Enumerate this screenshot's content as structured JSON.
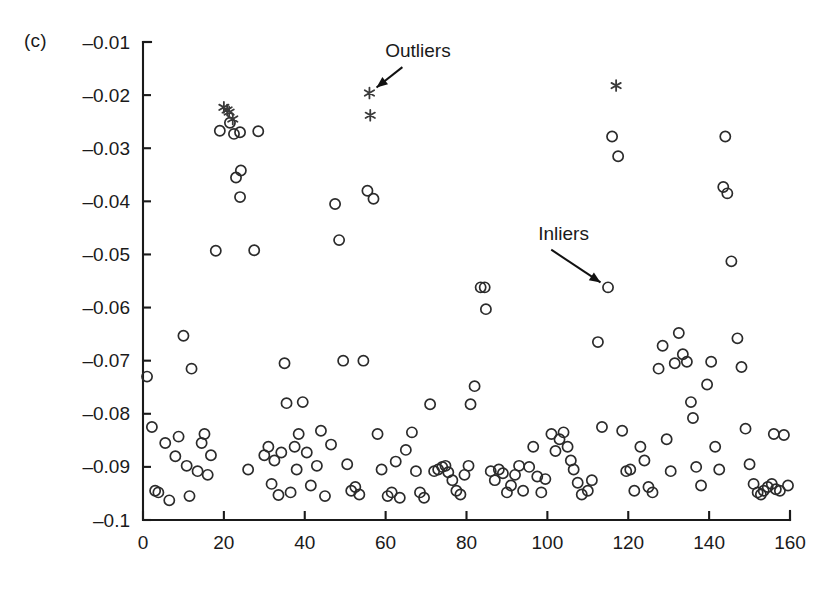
{
  "figure": {
    "panel_label": "(c)"
  },
  "annotations": [
    {
      "name": "outliers",
      "text": "Outliers",
      "x_data": 68.0,
      "y_data": -0.0128,
      "target_x": 56.0,
      "target_y": -0.0196
    },
    {
      "name": "inliers",
      "text": "Inliers",
      "x_data": 104.0,
      "y_data": -0.0472,
      "target_x": 115.0,
      "target_y": -0.0562
    }
  ],
  "chart_data": {
    "type": "scatter",
    "title": "",
    "xlabel": "",
    "ylabel": "",
    "xlim": [
      0,
      160
    ],
    "ylim": [
      -0.1,
      -0.01
    ],
    "grid": false,
    "legend": "none",
    "xticks": [
      0,
      20,
      40,
      60,
      80,
      100,
      120,
      140,
      160
    ],
    "xtick_labels": [
      "0",
      "20",
      "40",
      "60",
      "80",
      "100",
      "120",
      "140",
      "160"
    ],
    "yticks": [
      -0.01,
      -0.02,
      -0.03,
      -0.04,
      -0.05,
      -0.06,
      -0.07,
      -0.08,
      -0.09,
      -0.1
    ],
    "ytick_labels": [
      "–0.01",
      "–0.02",
      "–0.03",
      "–0.04",
      "–0.05",
      "–0.06",
      "–0.07",
      "–0.08",
      "–0.09",
      "–0.1"
    ],
    "series": [
      {
        "name": "Inliers",
        "marker": "circle-open",
        "color": "#2b2b2b",
        "points": [
          [
            1.0,
            -0.073
          ],
          [
            2.2,
            -0.0825
          ],
          [
            3.0,
            -0.0945
          ],
          [
            3.8,
            -0.0948
          ],
          [
            5.5,
            -0.0855
          ],
          [
            6.5,
            -0.0963
          ],
          [
            8.0,
            -0.088
          ],
          [
            8.8,
            -0.0843
          ],
          [
            10.0,
            -0.0653
          ],
          [
            10.8,
            -0.0898
          ],
          [
            11.5,
            -0.0955
          ],
          [
            12.0,
            -0.0715
          ],
          [
            13.5,
            -0.0908
          ],
          [
            14.5,
            -0.0855
          ],
          [
            15.2,
            -0.0838
          ],
          [
            16.0,
            -0.0915
          ],
          [
            16.8,
            -0.0878
          ],
          [
            18.0,
            -0.0493
          ],
          [
            19.0,
            -0.0267
          ],
          [
            21.5,
            -0.0252
          ],
          [
            22.5,
            -0.0273
          ],
          [
            24.0,
            -0.027
          ],
          [
            23.0,
            -0.0355
          ],
          [
            24.2,
            -0.0342
          ],
          [
            24.0,
            -0.0392
          ],
          [
            26.0,
            -0.0905
          ],
          [
            27.5,
            -0.0492
          ],
          [
            28.5,
            -0.0268
          ],
          [
            30.0,
            -0.0878
          ],
          [
            31.0,
            -0.0862
          ],
          [
            31.8,
            -0.0932
          ],
          [
            32.5,
            -0.0888
          ],
          [
            33.5,
            -0.0953
          ],
          [
            34.2,
            -0.0873
          ],
          [
            35.0,
            -0.0705
          ],
          [
            35.5,
            -0.078
          ],
          [
            36.5,
            -0.0948
          ],
          [
            37.5,
            -0.0862
          ],
          [
            38.5,
            -0.0838
          ],
          [
            38.0,
            -0.0905
          ],
          [
            39.5,
            -0.0778
          ],
          [
            40.5,
            -0.0873
          ],
          [
            41.5,
            -0.0935
          ],
          [
            43.0,
            -0.0898
          ],
          [
            44.0,
            -0.0832
          ],
          [
            45.0,
            -0.0955
          ],
          [
            46.5,
            -0.0858
          ],
          [
            47.5,
            -0.0405
          ],
          [
            48.5,
            -0.0473
          ],
          [
            49.5,
            -0.07
          ],
          [
            50.5,
            -0.0895
          ],
          [
            51.5,
            -0.0945
          ],
          [
            52.5,
            -0.0938
          ],
          [
            53.5,
            -0.0952
          ],
          [
            54.5,
            -0.07
          ],
          [
            55.5,
            -0.038
          ],
          [
            57.0,
            -0.0395
          ],
          [
            58.0,
            -0.0838
          ],
          [
            59.0,
            -0.0905
          ],
          [
            60.5,
            -0.0955
          ],
          [
            61.5,
            -0.0948
          ],
          [
            62.5,
            -0.089
          ],
          [
            63.5,
            -0.0958
          ],
          [
            65.0,
            -0.0868
          ],
          [
            66.5,
            -0.0835
          ],
          [
            67.5,
            -0.0908
          ],
          [
            68.5,
            -0.0948
          ],
          [
            69.5,
            -0.0958
          ],
          [
            71.0,
            -0.0782
          ],
          [
            72.0,
            -0.0908
          ],
          [
            73.0,
            -0.0905
          ],
          [
            74.0,
            -0.09
          ],
          [
            74.8,
            -0.0898
          ],
          [
            75.5,
            -0.091
          ],
          [
            76.5,
            -0.0925
          ],
          [
            77.5,
            -0.0945
          ],
          [
            78.5,
            -0.0952
          ],
          [
            79.5,
            -0.0915
          ],
          [
            80.5,
            -0.0898
          ],
          [
            81.0,
            -0.0782
          ],
          [
            82.0,
            -0.0748
          ],
          [
            83.5,
            -0.0562
          ],
          [
            84.5,
            -0.0562
          ],
          [
            84.8,
            -0.0603
          ],
          [
            86.0,
            -0.0908
          ],
          [
            87.0,
            -0.0925
          ],
          [
            88.0,
            -0.0905
          ],
          [
            89.0,
            -0.0912
          ],
          [
            90.0,
            -0.0948
          ],
          [
            91.0,
            -0.0935
          ],
          [
            92.0,
            -0.0915
          ],
          [
            93.0,
            -0.0898
          ],
          [
            94.0,
            -0.0945
          ],
          [
            95.5,
            -0.09
          ],
          [
            96.5,
            -0.0862
          ],
          [
            97.5,
            -0.0918
          ],
          [
            98.5,
            -0.0948
          ],
          [
            99.5,
            -0.0923
          ],
          [
            101.0,
            -0.0838
          ],
          [
            102.0,
            -0.087
          ],
          [
            103.0,
            -0.0848
          ],
          [
            104.0,
            -0.0835
          ],
          [
            105.0,
            -0.0862
          ],
          [
            105.8,
            -0.0888
          ],
          [
            106.5,
            -0.0905
          ],
          [
            107.5,
            -0.093
          ],
          [
            108.5,
            -0.0952
          ],
          [
            110.0,
            -0.0945
          ],
          [
            111.0,
            -0.0925
          ],
          [
            112.5,
            -0.0665
          ],
          [
            113.5,
            -0.0825
          ],
          [
            115.0,
            -0.0562
          ],
          [
            116.0,
            -0.0278
          ],
          [
            117.5,
            -0.0315
          ],
          [
            118.5,
            -0.0832
          ],
          [
            119.5,
            -0.0908
          ],
          [
            120.5,
            -0.0905
          ],
          [
            121.5,
            -0.0945
          ],
          [
            123.0,
            -0.0862
          ],
          [
            124.0,
            -0.0888
          ],
          [
            125.0,
            -0.0938
          ],
          [
            126.0,
            -0.0948
          ],
          [
            127.5,
            -0.0715
          ],
          [
            128.5,
            -0.0672
          ],
          [
            129.5,
            -0.0848
          ],
          [
            130.5,
            -0.0908
          ],
          [
            131.5,
            -0.0705
          ],
          [
            132.5,
            -0.0648
          ],
          [
            133.5,
            -0.0688
          ],
          [
            134.5,
            -0.0702
          ],
          [
            135.5,
            -0.0778
          ],
          [
            136.0,
            -0.0808
          ],
          [
            136.8,
            -0.09
          ],
          [
            138.0,
            -0.0935
          ],
          [
            139.5,
            -0.0745
          ],
          [
            140.5,
            -0.0702
          ],
          [
            141.5,
            -0.0862
          ],
          [
            142.5,
            -0.0905
          ],
          [
            143.5,
            -0.0373
          ],
          [
            144.5,
            -0.0385
          ],
          [
            144.0,
            -0.0278
          ],
          [
            145.5,
            -0.0513
          ],
          [
            147.0,
            -0.0658
          ],
          [
            148.0,
            -0.0712
          ],
          [
            149.0,
            -0.0828
          ],
          [
            150.0,
            -0.0895
          ],
          [
            151.0,
            -0.0932
          ],
          [
            152.0,
            -0.0948
          ],
          [
            152.8,
            -0.0952
          ],
          [
            153.5,
            -0.0945
          ],
          [
            154.5,
            -0.0938
          ],
          [
            155.5,
            -0.0932
          ],
          [
            156.5,
            -0.0942
          ],
          [
            157.5,
            -0.0945
          ],
          [
            156.0,
            -0.0838
          ],
          [
            158.5,
            -0.084
          ],
          [
            159.5,
            -0.0935
          ]
        ]
      },
      {
        "name": "Outliers",
        "marker": "asterisk",
        "color": "#3a3a3a",
        "points": [
          [
            20.0,
            -0.0223
          ],
          [
            20.8,
            -0.0228
          ],
          [
            21.3,
            -0.0232
          ],
          [
            22.2,
            -0.0245
          ],
          [
            56.0,
            -0.0196
          ],
          [
            56.2,
            -0.0238
          ],
          [
            117.0,
            -0.0182
          ]
        ]
      }
    ]
  }
}
